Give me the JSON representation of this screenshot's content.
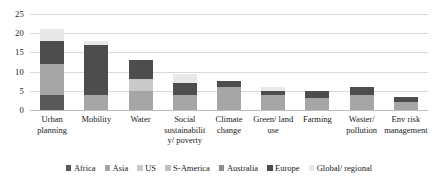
{
  "chart_data": {
    "type": "bar",
    "subtype": "stacked-vertical",
    "title": "",
    "xlabel": "",
    "ylabel": "",
    "ylim": [
      0,
      25
    ],
    "yticks": [
      0,
      5,
      10,
      15,
      20,
      25
    ],
    "ytick_labels": [
      "0",
      "5",
      "10",
      "15",
      "20",
      "25"
    ],
    "grid": true,
    "grid_axis": "y",
    "legend_position": "bottom",
    "categories": [
      "Urban planning",
      "Mobility",
      "Water",
      "Social sustainability/ poverty",
      "Climate change",
      "Green/ land use",
      "Farming",
      "Waster/ pollution",
      "Env risk management"
    ],
    "series": [
      {
        "name": "Africa",
        "color": "#595959",
        "values": [
          4,
          0,
          0,
          0,
          0,
          0,
          0,
          0,
          0
        ]
      },
      {
        "name": "Asia",
        "color": "#a6a6a6",
        "values": [
          8,
          4,
          5,
          4,
          6,
          4,
          3,
          4,
          2
        ]
      },
      {
        "name": "US",
        "color": "#c9c9c9",
        "values": [
          0,
          0,
          3,
          0,
          0,
          0,
          0,
          0,
          0
        ]
      },
      {
        "name": "S-America",
        "color": "#bfbfbf",
        "values": [
          0,
          0,
          0,
          0,
          0,
          0,
          0,
          0,
          0
        ]
      },
      {
        "name": "Australia",
        "color": "#8c8c8c",
        "values": [
          0,
          0,
          0,
          0,
          0,
          0,
          0,
          0,
          0
        ]
      },
      {
        "name": "Europe",
        "color": "#4d4d4d",
        "values": [
          6,
          13,
          5,
          3,
          1.5,
          1,
          2,
          2,
          1.5
        ]
      },
      {
        "name": "Global/ regional",
        "color": "#e8e8e8",
        "values": [
          3,
          1,
          0,
          2.5,
          0,
          1,
          0,
          0,
          0
        ]
      }
    ],
    "totals": [
      21,
      18,
      13,
      9.5,
      7.5,
      6,
      5,
      6,
      3.5
    ]
  },
  "legend": {
    "items": [
      {
        "label": "Africa"
      },
      {
        "label": "Asia"
      },
      {
        "label": "US"
      },
      {
        "label": "S-America"
      },
      {
        "label": "Australia"
      },
      {
        "label": "Europe"
      },
      {
        "label": "Global/ regional"
      }
    ]
  }
}
